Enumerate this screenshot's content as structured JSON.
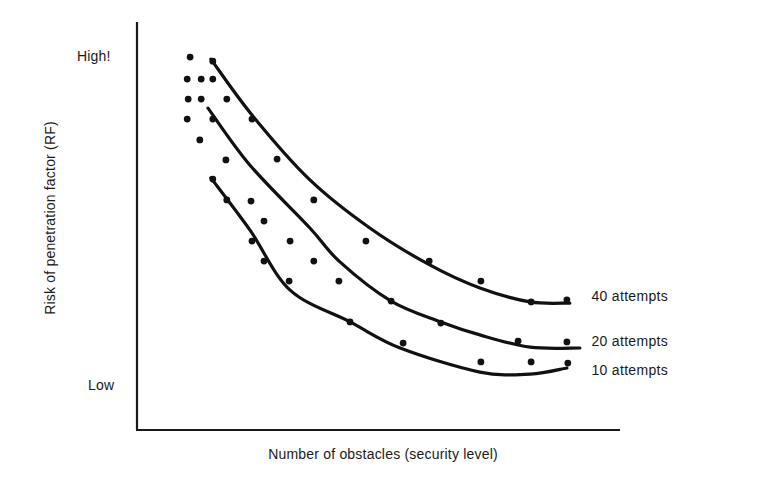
{
  "chart_data": {
    "type": "scatter",
    "title": "",
    "xlabel": "Number of obstacles (security level)",
    "ylabel": "Risk of penetration factor (RF)",
    "y_tick_labels": {
      "high": "High!",
      "low": "Low"
    },
    "x_tick_labels": [],
    "xlim": [
      0,
      100
    ],
    "ylim": [
      0,
      100
    ],
    "units_note": "Axes are qualitative; values are relative positions 0-100 along each axis",
    "grid": false,
    "legend_position": "inline-right",
    "series": [
      {
        "name": "40 attempts",
        "kind": "fitted-curve",
        "curve": [
          [
            15.3,
            90.9
          ],
          [
            23.8,
            77.2
          ],
          [
            35.8,
            61.3
          ],
          [
            48.2,
            49.5
          ],
          [
            60.7,
            40.4
          ],
          [
            71.0,
            34.8
          ],
          [
            81.4,
            31.4
          ],
          [
            89.6,
            31.1
          ]
        ],
        "label_position": [
          94.1,
          32.4
        ]
      },
      {
        "name": "20 attempts",
        "kind": "fitted-curve",
        "curve": [
          [
            14.7,
            78.9
          ],
          [
            23.4,
            64.9
          ],
          [
            35.8,
            49.5
          ],
          [
            42.0,
            41.2
          ],
          [
            52.6,
            31.6
          ],
          [
            62.9,
            26.5
          ],
          [
            71.0,
            23.3
          ],
          [
            81.4,
            20.3
          ],
          [
            91.7,
            20.1
          ]
        ],
        "label_position": [
          94.1,
          21.3
        ]
      },
      {
        "name": "10 attempts",
        "kind": "fitted-curve",
        "curve": [
          [
            15.3,
            61.8
          ],
          [
            23.4,
            49.0
          ],
          [
            31.7,
            34.3
          ],
          [
            44.1,
            26.5
          ],
          [
            54.5,
            20.1
          ],
          [
            71.0,
            14.2
          ],
          [
            81.4,
            13.7
          ],
          [
            89.0,
            15.2
          ]
        ],
        "label_position": [
          94.1,
          14.2
        ]
      }
    ],
    "points": [
      [
        11.0,
        91.4
      ],
      [
        15.7,
        90.4
      ],
      [
        10.4,
        86.0
      ],
      [
        13.3,
        86.0
      ],
      [
        15.7,
        86.0
      ],
      [
        10.6,
        81.1
      ],
      [
        13.3,
        81.1
      ],
      [
        18.6,
        81.1
      ],
      [
        10.4,
        76.2
      ],
      [
        15.7,
        76.2
      ],
      [
        23.8,
        76.2
      ],
      [
        13.0,
        71.1
      ],
      [
        18.4,
        66.2
      ],
      [
        29.0,
        66.4
      ],
      [
        15.7,
        61.5
      ],
      [
        18.6,
        56.4
      ],
      [
        23.6,
        56.1
      ],
      [
        36.6,
        56.4
      ],
      [
        26.3,
        51.2
      ],
      [
        23.8,
        46.3
      ],
      [
        31.7,
        46.3
      ],
      [
        47.4,
        46.3
      ],
      [
        26.3,
        41.4
      ],
      [
        36.6,
        41.4
      ],
      [
        60.5,
        41.4
      ],
      [
        31.5,
        36.5
      ],
      [
        41.8,
        36.5
      ],
      [
        71.2,
        36.5
      ],
      [
        52.6,
        31.6
      ],
      [
        81.6,
        31.4
      ],
      [
        89.0,
        31.9
      ],
      [
        44.1,
        26.5
      ],
      [
        62.9,
        26.2
      ],
      [
        78.9,
        21.8
      ],
      [
        89.0,
        21.6
      ],
      [
        55.1,
        21.3
      ],
      [
        71.2,
        16.7
      ],
      [
        81.6,
        16.7
      ],
      [
        89.2,
        16.4
      ]
    ],
    "plot_box_px": {
      "x0": 137,
      "x1": 620,
      "y_top": 22,
      "y_axis": 430
    },
    "colors": {
      "ink": "#111111",
      "background": "#ffffff"
    }
  }
}
